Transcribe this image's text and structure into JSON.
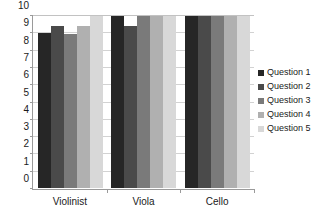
{
  "chart_data": {
    "type": "bar",
    "title": "",
    "subtitle": "",
    "xlabel": "",
    "ylabel": "",
    "categories": [
      "Violinist",
      "Viola",
      "Cello"
    ],
    "series": [
      {
        "name": "Question 1",
        "color": "#262626",
        "values": [
          9.0,
          10.0,
          10.0
        ]
      },
      {
        "name": "Question 2",
        "color": "#4a4a4a",
        "values": [
          9.4,
          9.4,
          10.0
        ]
      },
      {
        "name": "Question 3",
        "color": "#7a7a7a",
        "values": [
          8.95,
          10.0,
          10.0
        ]
      },
      {
        "name": "Question 4",
        "color": "#b0b0b0",
        "values": [
          9.4,
          10.0,
          10.0
        ]
      },
      {
        "name": "Question 5",
        "color": "#d8d8d8",
        "values": [
          10.0,
          10.0,
          10.0
        ]
      }
    ],
    "ylim": [
      0,
      10
    ],
    "yticks": [
      0,
      1,
      2,
      3,
      4,
      5,
      6,
      7,
      8,
      9,
      10
    ],
    "ytick_labels": [
      "0",
      "1",
      "2",
      "3",
      "4",
      "5",
      "6",
      "7",
      "8",
      "9",
      "10"
    ],
    "grid": true,
    "grid_axis": "y",
    "legend_position": "right",
    "legend_entries": [
      "Question 1",
      "Question 2",
      "Question 3",
      "Question 4",
      "Question 5"
    ]
  }
}
